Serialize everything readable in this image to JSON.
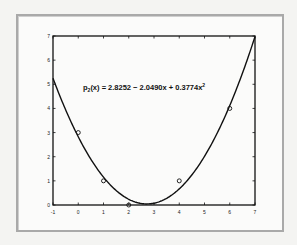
{
  "chart_data": {
    "type": "line",
    "title": "",
    "xlabel": "",
    "ylabel": "",
    "xlim": [
      -1,
      7
    ],
    "ylim": [
      0,
      7
    ],
    "xticks": [
      -1,
      0,
      1,
      2,
      3,
      4,
      5,
      6,
      7
    ],
    "yticks": [
      0,
      1,
      2,
      3,
      4,
      5,
      6,
      7
    ],
    "grid": false,
    "annotation": {
      "prefix": "p",
      "subscript": "2",
      "body": "(x) = 2.8252 − 2.0490x + 0.3774x",
      "superscript": "2"
    },
    "series": [
      {
        "name": "data points",
        "type": "scatter",
        "marker": "circle",
        "x": [
          0,
          1,
          2,
          4,
          6
        ],
        "y": [
          3,
          1,
          0,
          1,
          4
        ]
      },
      {
        "name": "quadratic fit p2(x)",
        "type": "line",
        "coefficients": [
          2.8252,
          -2.049,
          0.3774
        ],
        "x_range": [
          -1,
          7
        ]
      }
    ]
  }
}
